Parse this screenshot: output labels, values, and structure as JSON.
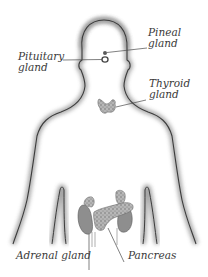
{
  "diagram": {
    "labels": {
      "pineal": {
        "line1": "Pineal",
        "line2": "gland"
      },
      "pituitary": {
        "line1": "Pituitary",
        "line2": "gland"
      },
      "thyroid": {
        "line1": "Thyroid",
        "line2": "gland"
      },
      "adrenal": {
        "text": "Adrenal gland"
      },
      "pancreas": {
        "text": "Pancreas"
      }
    },
    "colors": {
      "outline": "#3c3c3c",
      "shadow": "#9a9a9a",
      "gland_fill": "#a8a8a8",
      "text": "#3a3a3a"
    }
  }
}
